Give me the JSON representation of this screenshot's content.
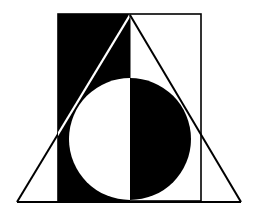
{
  "figure": {
    "colors": {
      "background": "#ffffff",
      "ink": "#000000"
    },
    "rectangle": {
      "x": 58,
      "y": 14,
      "width": 143,
      "height": 187
    },
    "triangle": {
      "apex": [
        130,
        15
      ],
      "base_left": [
        17,
        202
      ],
      "base_right": [
        241,
        202
      ]
    },
    "circle": {
      "cx": 130,
      "cy": 139,
      "r": 61
    },
    "divider_x": 130
  }
}
